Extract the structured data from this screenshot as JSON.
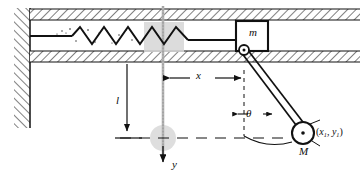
{
  "figure": {
    "labels": {
      "cart_mass": "m",
      "bob_mass": "M",
      "pendulum_length": "l",
      "cart_displacement": "x",
      "vertical_axis": "y",
      "angle": "θ",
      "bob_coordinates_x": "x",
      "bob_coordinates_y": "y",
      "bob_coordinates_sub": "1",
      "bob_coordinates_full": "(x1, y1)"
    },
    "colors": {
      "ink": "#111111",
      "hatch": "#4a4a4a",
      "ghost": "#c9c9c9",
      "ghost_fill": "#d8d8d8",
      "background": "#ffffff"
    },
    "elements": {
      "left_wall": "hatched vertical support wall",
      "top_channel_wall": "hatched horizontal ceiling rail",
      "bottom_channel_wall": "hatched horizontal floor rail",
      "spring": "coil spring connecting left wall to cart",
      "cart": "rectangular block labelled m sliding in channel",
      "pivot": "pin joint at lower-left corner of cart",
      "rod": "rigid massless rod of length l",
      "bob": "circular pendulum bob labelled M",
      "ghost_cart": "shaded equilibrium position of cart",
      "ghost_bob": "shaded equilibrium position of bob",
      "x_dimension": "double-headed horizontal dimension arrow for x",
      "l_dimension": "vertical dimension arrow for l",
      "theta_arc": "angle arc between vertical dashed line and rod",
      "y_arrow": "downward vertical axis arrow y",
      "datum_line": "dashed horizontal datum line",
      "vertical_centerline": "dashed vertical reference through equilibrium"
    }
  }
}
